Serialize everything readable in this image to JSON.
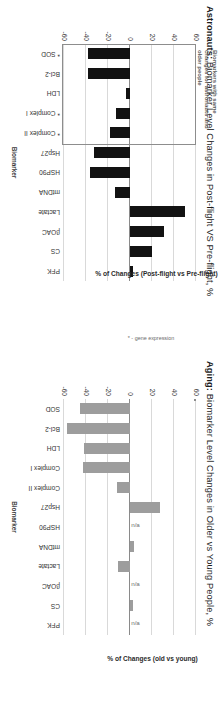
{
  "figure": {
    "panels": [
      {
        "id": "astronauts",
        "title_prefix": "Astronauts:",
        "title_rest": " Biomarker Level Changes in Post-flight VS Pre-flight, %",
        "x_axis_title": "Biomarker",
        "y_axis_title": "% of Changes (Post-flight vs Pre-flight)",
        "y_axis_note": "* - gene expression",
        "annotation": "Biomarkers with same changes for astronauts and older people"
      },
      {
        "id": "aging",
        "title_prefix": "Aging:",
        "title_rest": " Biomarker Level Changes in Older vs Young People, %",
        "x_axis_title": "Biomarker",
        "y_axis_title": "% of Changes (old vs young)",
        "y_axis_note": "",
        "annotation": ""
      }
    ]
  },
  "chart_data": [
    {
      "type": "bar",
      "id": "astronauts",
      "title": "Astronauts: Biomarker Level Changes in Post-flight VS Pre-flight, %",
      "xlabel": "Biomarker",
      "ylabel": "% of Changes (Post-flight vs Pre-flight)",
      "ylim": [
        -60,
        60
      ],
      "yticks": [
        -60,
        -40,
        -20,
        0,
        20,
        40,
        60
      ],
      "grid": true,
      "bar_color": "#121212",
      "categories": [
        "* SOD",
        "Bcl-2",
        "LDH",
        "* Complex I",
        "* Complex II",
        "Hsp27",
        "HSP90",
        "mtDNA",
        "Lactate",
        "βOAC",
        "CS",
        "PFK"
      ],
      "values": [
        -38,
        -38,
        -4,
        -13,
        -18,
        -33,
        -36,
        -14,
        50,
        31,
        20,
        3
      ],
      "na": [],
      "annotation": "Biomarkers with same changes for astronauts and older people",
      "note": "* - gene expression"
    },
    {
      "type": "bar",
      "id": "aging",
      "title": "Aging: Biomarker Level Changes in Older vs Young People, %",
      "xlabel": "Biomarker",
      "ylabel": "% of Changes (old vs young)",
      "ylim": [
        -60,
        60
      ],
      "yticks": [
        -60,
        -40,
        -20,
        0,
        20,
        40,
        60
      ],
      "grid": true,
      "bar_color": "#9d9d9d",
      "categories": [
        "SOD",
        "Bcl-2",
        "LDH",
        "Complex I",
        "Complex II",
        "Hsp27",
        "HSP90",
        "mtDNA",
        "Lactate",
        "βOAC",
        "CS",
        "PFK"
      ],
      "values": [
        -45,
        -57,
        -42,
        -43,
        -12,
        27,
        null,
        4,
        -11,
        null,
        3,
        null
      ],
      "na": [
        false,
        false,
        false,
        false,
        false,
        false,
        true,
        false,
        false,
        true,
        false,
        true
      ],
      "na_label": "n/a",
      "annotation": "",
      "note": ""
    }
  ]
}
